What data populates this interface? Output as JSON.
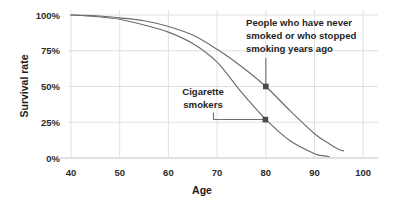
{
  "chart_data": {
    "type": "line",
    "title": "",
    "xlabel": "Age",
    "ylabel": "Survival rate",
    "xlim": [
      35,
      103
    ],
    "ylim": [
      0,
      100
    ],
    "grid": true,
    "legend": "none (direct annotations)",
    "x_ticks": [
      "40",
      "50",
      "60",
      "70",
      "80",
      "90",
      "100"
    ],
    "x_tick_values": [
      40,
      50,
      60,
      70,
      80,
      90,
      100
    ],
    "y_ticks": [
      "0%",
      "25%",
      "50%",
      "75%",
      "100%"
    ],
    "y_tick_values": [
      0,
      25,
      50,
      75,
      100
    ],
    "series": [
      {
        "name": "People who have never smoked or who stopped smoking years ago",
        "color": "#6b6b70",
        "x": [
          40,
          45,
          50,
          55,
          60,
          65,
          70,
          75,
          80,
          85,
          90,
          93,
          95,
          96
        ],
        "values": [
          100,
          99.5,
          98,
          96,
          92,
          86,
          76,
          64,
          50,
          33,
          17,
          10,
          6,
          5
        ]
      },
      {
        "name": "Cigarette smokers",
        "color": "#6b6b70",
        "x": [
          40,
          45,
          50,
          55,
          60,
          65,
          70,
          75,
          80,
          85,
          90,
          92,
          93
        ],
        "values": [
          100,
          99,
          97,
          93,
          88,
          80,
          67,
          46,
          27,
          12,
          3,
          1.5,
          1
        ]
      }
    ],
    "annotations": [
      {
        "id": "never-smoked",
        "lines": [
          "People who have never",
          "smoked or who stopped",
          "smoking years ago"
        ],
        "point": {
          "x": 80,
          "y": 50
        },
        "point_label": "50% at age 80",
        "marker": true
      },
      {
        "id": "cigarette-smokers",
        "lines": [
          "Cigarette",
          "smokers"
        ],
        "point": {
          "x": 80,
          "y": 27
        },
        "point_label": "27% at age 80",
        "marker": true
      }
    ]
  },
  "colors": {
    "line": "#6b6b70",
    "grid": "#d9d9dd",
    "axis": "#bdbdc2",
    "text": "#1f1f1f",
    "marker": "#4a4a4e",
    "background": "#ffffff"
  }
}
